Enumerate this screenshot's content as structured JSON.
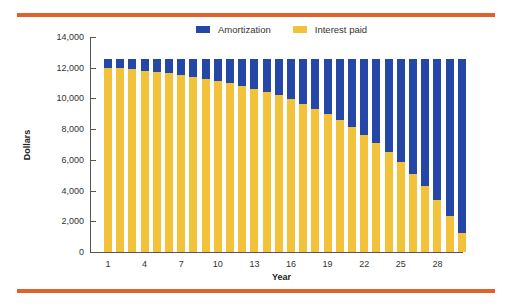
{
  "legend": {
    "amortization_label": "Amortization",
    "interest_label": "Interest paid"
  },
  "colors": {
    "amortization": "#2548a8",
    "interest": "#f2c23a",
    "rule": "#e0622b"
  },
  "axis": {
    "xlabel": "Year",
    "ylabel": "Dollars",
    "yticks": [
      "0",
      "2,000",
      "4,000",
      "6,000",
      "8,000",
      "10,000",
      "12,000",
      "14,000"
    ],
    "xticks": [
      "1",
      "4",
      "7",
      "10",
      "13",
      "16",
      "19",
      "22",
      "25",
      "28"
    ]
  },
  "chart_data": {
    "type": "bar",
    "stacked": true,
    "title": "",
    "xlabel": "Year",
    "ylabel": "Dollars",
    "ylim": [
      0,
      14000
    ],
    "grid": false,
    "legend_position": "top",
    "categories": [
      1,
      2,
      3,
      4,
      5,
      6,
      7,
      8,
      9,
      10,
      11,
      12,
      13,
      14,
      15,
      16,
      17,
      18,
      19,
      20,
      21,
      22,
      23,
      24,
      25,
      26,
      27,
      28,
      29,
      30
    ],
    "series": [
      {
        "name": "Interest paid",
        "values": [
          12011,
          11951,
          11884,
          11810,
          11727,
          11636,
          11534,
          11421,
          11295,
          11157,
          11003,
          10831,
          10641,
          10430,
          10195,
          9935,
          9646,
          9326,
          8970,
          8575,
          8136,
          7650,
          7110,
          6510,
          5845,
          5106,
          4287,
          3376,
          2366,
          1245
        ]
      },
      {
        "name": "Amortization",
        "values": [
          549,
          609,
          676,
          750,
          833,
          924,
          1026,
          1139,
          1265,
          1403,
          1557,
          1729,
          1919,
          2130,
          2365,
          2625,
          2914,
          3234,
          3590,
          3985,
          4424,
          4910,
          5450,
          6050,
          6715,
          7454,
          8273,
          9184,
          10194,
          11315
        ]
      }
    ],
    "total_payment": 12560
  }
}
